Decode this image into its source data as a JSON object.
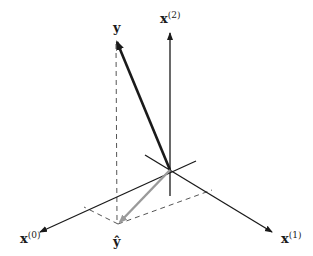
{
  "diagram": {
    "labels": {
      "y": "y",
      "y_hat": "ŷ",
      "x0_base": "x",
      "x0_sup": "(0)",
      "x1_base": "x",
      "x1_sup": "(1)",
      "x2_base": "x",
      "x2_sup": "(2)"
    },
    "colors": {
      "axis": "#1a1a1a",
      "y_vector": "#1a1a1a",
      "y_hat_vector": "#9a9a9a",
      "dashed": "#555555"
    },
    "nodes": [
      {
        "id": "origin",
        "x": 170,
        "y": 170
      },
      {
        "id": "y",
        "x": 116,
        "y": 40
      },
      {
        "id": "y_hat",
        "x": 118,
        "y": 224
      }
    ],
    "edges": [
      {
        "from": "origin",
        "to": "y",
        "style": "thick-arrow"
      },
      {
        "from": "origin",
        "to": "y_hat",
        "style": "gray-arrow"
      },
      {
        "from": "y",
        "to": "y_hat",
        "style": "dashed"
      },
      {
        "from": "y_hat",
        "to": "x0_axis_point",
        "style": "dashed"
      },
      {
        "from": "y_hat",
        "to": "x1_axis_point",
        "style": "dashed"
      }
    ]
  }
}
